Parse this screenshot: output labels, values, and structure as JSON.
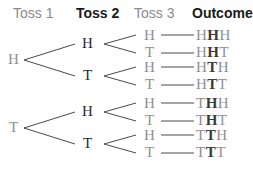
{
  "headers": {
    "toss1": "Toss 1",
    "toss2": "Toss 2",
    "toss3": "Toss 3",
    "outcome": "Outcome"
  },
  "toss1": [
    "H",
    "T"
  ],
  "toss2": [
    "H",
    "T",
    "H",
    "T"
  ],
  "toss3": [
    "H",
    "T",
    "H",
    "T",
    "H",
    "T",
    "H",
    "T"
  ],
  "outcomes": [
    {
      "a": "H",
      "b": "H",
      "c": "H"
    },
    {
      "a": "H",
      "b": "H",
      "c": "T"
    },
    {
      "a": "H",
      "b": "T",
      "c": "H"
    },
    {
      "a": "H",
      "b": "T",
      "c": "T"
    },
    {
      "a": "T",
      "b": "H",
      "c": "H"
    },
    {
      "a": "T",
      "b": "H",
      "c": "T"
    },
    {
      "a": "T",
      "b": "T",
      "c": "H"
    },
    {
      "a": "T",
      "b": "T",
      "c": "T"
    }
  ]
}
